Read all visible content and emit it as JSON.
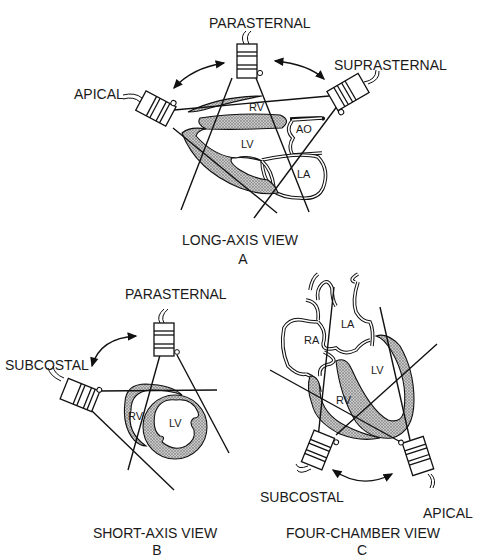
{
  "panels": [
    {
      "id": "A",
      "caption": "LONG-AXIS VIEW",
      "letter": "A",
      "probes": [
        "PARASTERNAL",
        "SUPRASTERNAL",
        "APICAL"
      ],
      "structures": [
        "RV",
        "LV",
        "AO",
        "LA"
      ]
    },
    {
      "id": "B",
      "caption": "SHORT-AXIS VIEW",
      "letter": "B",
      "probes": [
        "PARASTERNAL",
        "SUBCOSTAL"
      ],
      "structures": [
        "RV",
        "LV"
      ]
    },
    {
      "id": "C",
      "caption": "FOUR-CHAMBER VIEW",
      "letter": "C",
      "probes": [
        "SUBCOSTAL",
        "APICAL"
      ],
      "structures": [
        "LA",
        "RA",
        "LV",
        "RV"
      ]
    }
  ]
}
